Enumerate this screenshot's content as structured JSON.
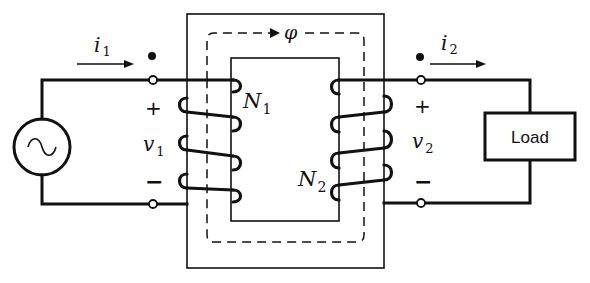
{
  "diagram": {
    "type": "ideal transformer circuit",
    "source": {
      "symbol": "~",
      "icon": "ac-source-icon"
    },
    "load": {
      "label": "Load"
    },
    "flux": {
      "symbol": "φ"
    },
    "primary": {
      "current": {
        "symbol": "i",
        "subscript": "1"
      },
      "voltage": {
        "symbol": "v",
        "subscript": "1"
      },
      "turns": {
        "symbol": "N",
        "subscript": "1"
      },
      "plus": "+",
      "minus": "−"
    },
    "secondary": {
      "current": {
        "symbol": "i",
        "subscript": "2"
      },
      "voltage": {
        "symbol": "v",
        "subscript": "2"
      },
      "turns": {
        "symbol": "N",
        "subscript": "2"
      },
      "plus": "+",
      "minus": "−"
    }
  }
}
